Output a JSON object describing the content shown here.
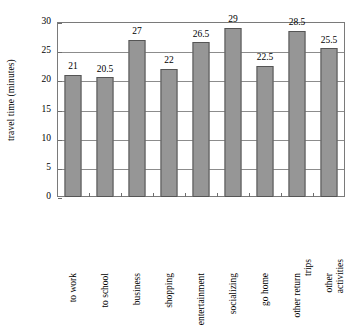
{
  "chart_data": {
    "type": "bar",
    "title": "",
    "xlabel": "",
    "ylabel": "travel time (minutes)",
    "ylim": [
      0,
      30
    ],
    "ytick_step": 5,
    "yticks": [
      30,
      25,
      20,
      15,
      10,
      5,
      0
    ],
    "grid": true,
    "legend": "none",
    "categories": [
      "to work",
      "to school",
      "business",
      "shopping",
      "entertainment",
      "socializing",
      "go home",
      "other return trips",
      "other activities"
    ],
    "category_lines": [
      [
        "to work"
      ],
      [
        "to school"
      ],
      [
        "business"
      ],
      [
        "shopping"
      ],
      [
        "entertainment"
      ],
      [
        "socializing"
      ],
      [
        "go home"
      ],
      [
        "other return",
        "trips"
      ],
      [
        "other",
        "activities"
      ]
    ],
    "values": [
      21,
      20.5,
      27,
      22,
      26.5,
      29,
      22.5,
      28.5,
      25.5
    ],
    "value_labels": [
      "21",
      "20.5",
      "27",
      "22",
      "26.5",
      "29",
      "22.5",
      "28.5",
      "25.5"
    ],
    "bar_color": "#969696",
    "bar_border_color": "#555555",
    "axis_color": "#7a7a7a",
    "gridline_color": "#8c8c8c",
    "background_color": "#ffffff",
    "text_color": "#000000"
  }
}
